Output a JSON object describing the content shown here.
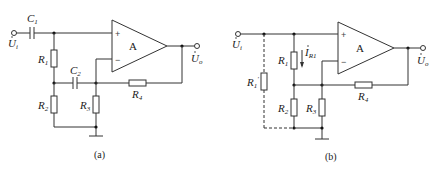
{
  "panels": [
    {
      "id": "a",
      "caption": "(a)",
      "amplifier_label": "A",
      "plus_sign": "+",
      "minus_sign": "−",
      "components": {
        "C1": {
          "name": "C",
          "sub": "1"
        },
        "C2": {
          "name": "C",
          "sub": "2"
        },
        "R1": {
          "name": "R",
          "sub": "1"
        },
        "R2": {
          "name": "R",
          "sub": "2"
        },
        "R3": {
          "name": "R",
          "sub": "3"
        },
        "R4": {
          "name": "R",
          "sub": "4"
        }
      },
      "input": {
        "name": "U",
        "sub": "i"
      },
      "output": {
        "name": "U",
        "sub": "o"
      }
    },
    {
      "id": "b",
      "caption": "(b)",
      "amplifier_label": "A",
      "plus_sign": "+",
      "minus_sign": "−",
      "components": {
        "R1p": {
          "name": "R",
          "sub": "1",
          "prime": "′"
        },
        "R1": {
          "name": "R",
          "sub": "1"
        },
        "R2": {
          "name": "R",
          "sub": "2"
        },
        "R3": {
          "name": "R",
          "sub": "3"
        },
        "R4": {
          "name": "R",
          "sub": "4"
        }
      },
      "current": {
        "name": "I",
        "sub": "R1"
      },
      "input": {
        "name": "U",
        "sub": "i"
      },
      "output": {
        "name": "U",
        "sub": "o"
      }
    }
  ]
}
